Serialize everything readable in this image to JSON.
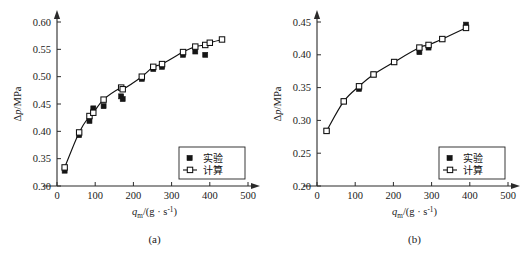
{
  "figure": {
    "background": "#ffffff",
    "ink": "#111111",
    "panel_count": 2
  },
  "legend": {
    "experiment_label": "实验",
    "calculation_label": "计算",
    "experiment_marker": "filled-square",
    "calculation_marker": "open-square-with-line"
  },
  "axis_text": {
    "xlabel_symbol": "q",
    "xlabel_subscript": "m",
    "xlabel_units": "/(g · s",
    "xlabel_units_exp": "-1",
    "xlabel_units_close": ")",
    "ylabel": "Δp/MPa",
    "ylabel_symbol": "Δp",
    "ylabel_units": "/MPa"
  },
  "chart_data": [
    {
      "id": "panel-a",
      "type": "scatter",
      "title": "",
      "caption": "(a)",
      "xlabel": "q_m/(g · s^-1)",
      "ylabel": "Δp/MPa",
      "xlim": [
        0,
        500
      ],
      "ylim": [
        0.3,
        0.6
      ],
      "xticks": [
        0,
        100,
        200,
        300,
        400,
        500
      ],
      "yticks": [
        0.3,
        0.35,
        0.4,
        0.45,
        0.5,
        0.55,
        0.6
      ],
      "xticklabels": [
        "0",
        "100",
        "200",
        "300",
        "400",
        "500"
      ],
      "yticklabels": [
        "0.30",
        "0.35",
        "0.40",
        "0.45",
        "0.50",
        "0.55",
        "0.60"
      ],
      "grid": false,
      "legend_position": "lower-right",
      "series": [
        {
          "name": "计算",
          "marker": "open-square",
          "line": true,
          "x": [
            20,
            58,
            85,
            95,
            122,
            168,
            172,
            222,
            252,
            275,
            330,
            362,
            388,
            400,
            432
          ],
          "y": [
            0.334,
            0.398,
            0.428,
            0.434,
            0.458,
            0.48,
            0.477,
            0.5,
            0.518,
            0.523,
            0.545,
            0.555,
            0.558,
            0.562,
            0.568
          ]
        },
        {
          "name": "实验",
          "marker": "filled-square",
          "line": false,
          "x": [
            20,
            58,
            85,
            95,
            122,
            168,
            172,
            222,
            252,
            275,
            330,
            362,
            388
          ],
          "y": [
            0.328,
            0.393,
            0.419,
            0.442,
            0.446,
            0.464,
            0.459,
            0.496,
            0.514,
            0.518,
            0.54,
            0.546,
            0.54
          ]
        }
      ]
    },
    {
      "id": "panel-b",
      "type": "scatter",
      "title": "",
      "caption": "(b)",
      "xlabel": "q_m/(g · s^-1)",
      "ylabel": "Δp/MPa",
      "xlim": [
        0,
        500
      ],
      "ylim": [
        0.2,
        0.45
      ],
      "xticks": [
        0,
        100,
        200,
        300,
        400,
        500
      ],
      "yticks": [
        0.2,
        0.25,
        0.3,
        0.35,
        0.4,
        0.45
      ],
      "xticklabels": [
        "0",
        "100",
        "200",
        "300",
        "400",
        "500"
      ],
      "yticklabels": [
        "0.20",
        "0.25",
        "0.30",
        "0.35",
        "0.40",
        "0.45"
      ],
      "grid": false,
      "legend_position": "lower-right",
      "series": [
        {
          "name": "计算",
          "marker": "open-square",
          "line": true,
          "x": [
            25,
            70,
            110,
            148,
            202,
            268,
            292,
            328,
            390
          ],
          "y": [
            0.284,
            0.329,
            0.352,
            0.37,
            0.389,
            0.411,
            0.415,
            0.424,
            0.441
          ]
        },
        {
          "name": "实验",
          "marker": "filled-square",
          "line": false,
          "x": [
            25,
            70,
            110,
            148,
            202,
            268,
            292,
            328,
            390
          ],
          "y": [
            0.284,
            0.329,
            0.348,
            0.37,
            0.389,
            0.404,
            0.411,
            0.424,
            0.446
          ]
        }
      ]
    }
  ]
}
